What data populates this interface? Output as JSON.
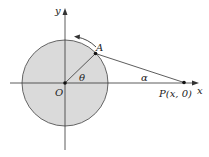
{
  "diagram": {
    "axes": {
      "x_label": "x",
      "y_label": "y"
    },
    "origin_label": "O",
    "point_a_label": "A",
    "point_p_label": "P(x, 0)",
    "angle_theta_label": "θ",
    "angle_alpha_label": "α",
    "colors": {
      "circle_fill": "#d9d9d9",
      "stroke": "#333333"
    }
  }
}
